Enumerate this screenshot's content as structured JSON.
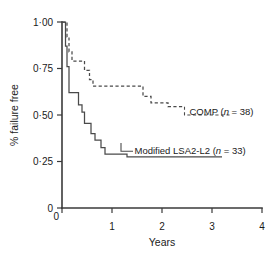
{
  "chart_data": {
    "type": "line",
    "subtype": "kaplan-meier-step",
    "title": "",
    "xlabel": "Years",
    "ylabel": "% failure free",
    "xlim": [
      0,
      4
    ],
    "ylim": [
      0,
      1.0
    ],
    "grid": false,
    "legend_position": "inline-annotation",
    "xticks": [
      0,
      1,
      2,
      3,
      4
    ],
    "xticklabels": [
      "0",
      "1",
      "2",
      "3",
      "4"
    ],
    "yticks": [
      0,
      0.25,
      0.5,
      0.75,
      1.0
    ],
    "yticklabels": [
      "0",
      "0·25",
      "0·50",
      "0·75",
      "1·00"
    ],
    "series": [
      {
        "name": "COMP",
        "label_prefix": "COMP (",
        "label_italic": "n",
        "label_suffix": " = 38)",
        "n": 38,
        "style": "dashed",
        "points": [
          [
            0.0,
            1.0
          ],
          [
            0.1,
            1.0
          ],
          [
            0.1,
            0.92
          ],
          [
            0.14,
            0.92
          ],
          [
            0.14,
            0.84
          ],
          [
            0.2,
            0.84
          ],
          [
            0.2,
            0.79
          ],
          [
            0.45,
            0.79
          ],
          [
            0.45,
            0.74
          ],
          [
            0.55,
            0.74
          ],
          [
            0.55,
            0.69
          ],
          [
            0.62,
            0.69
          ],
          [
            0.62,
            0.655
          ],
          [
            1.62,
            0.655
          ],
          [
            1.62,
            0.6
          ],
          [
            1.78,
            0.6
          ],
          [
            1.78,
            0.565
          ],
          [
            2.12,
            0.565
          ],
          [
            2.12,
            0.545
          ],
          [
            2.45,
            0.545
          ]
        ]
      },
      {
        "name": "Modified LSA2-L2",
        "label_prefix": "Modified LSA2-L2 (",
        "label_italic": "n",
        "label_suffix": " = 33)",
        "n": 33,
        "style": "solid",
        "points": [
          [
            0.0,
            1.0
          ],
          [
            0.07,
            1.0
          ],
          [
            0.07,
            0.87
          ],
          [
            0.1,
            0.87
          ],
          [
            0.1,
            0.76
          ],
          [
            0.14,
            0.76
          ],
          [
            0.14,
            0.62
          ],
          [
            0.33,
            0.62
          ],
          [
            0.33,
            0.555
          ],
          [
            0.4,
            0.555
          ],
          [
            0.4,
            0.515
          ],
          [
            0.45,
            0.515
          ],
          [
            0.45,
            0.455
          ],
          [
            0.58,
            0.455
          ],
          [
            0.58,
            0.4
          ],
          [
            0.66,
            0.4
          ],
          [
            0.66,
            0.365
          ],
          [
            0.78,
            0.365
          ],
          [
            0.78,
            0.325
          ],
          [
            0.86,
            0.325
          ],
          [
            0.86,
            0.29
          ],
          [
            1.3,
            0.29
          ],
          [
            1.3,
            0.275
          ],
          [
            3.2,
            0.275
          ]
        ]
      }
    ],
    "annotations": [
      {
        "id": "comp-annotation",
        "text_prefix": "COMP (",
        "text_italic": "n",
        "text_suffix": " = 38)",
        "x": 2.55,
        "y": 0.52
      },
      {
        "id": "lsa-annotation",
        "text_prefix": "Modified LSA2-L2 (",
        "text_italic": "n",
        "text_suffix": " = 33)",
        "x": 1.45,
        "y": 0.31
      }
    ],
    "colors": {
      "axis": "#3a3a3a",
      "curve": "#4a4a4a",
      "text": "#1a1a1a",
      "background": "#ffffff"
    }
  }
}
